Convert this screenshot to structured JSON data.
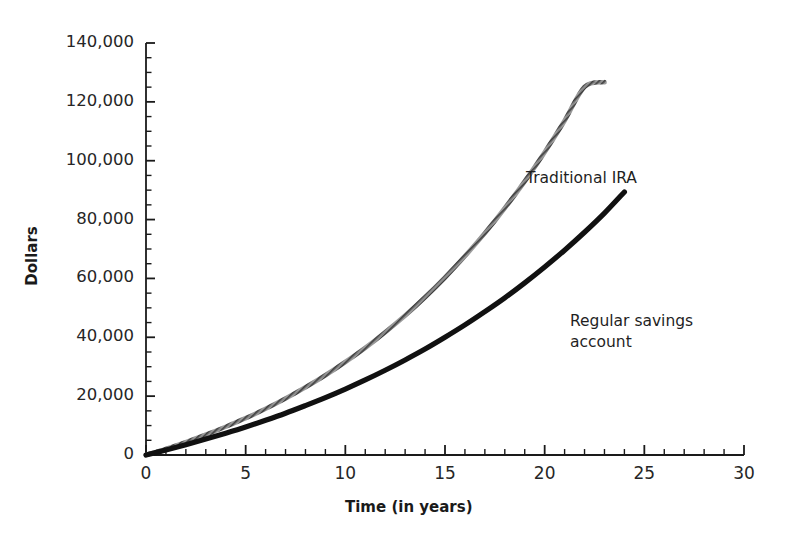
{
  "chart_data": {
    "type": "line",
    "title": "",
    "xlabel": "Time (in years)",
    "ylabel": "Dollars",
    "xlim": [
      0,
      30
    ],
    "ylim": [
      0,
      140000
    ],
    "grid": false,
    "legend_position": "inline-annotations",
    "x_ticks": [
      0,
      5,
      10,
      15,
      20,
      25,
      30
    ],
    "x_tick_labels": [
      "0",
      "5",
      "10",
      "15",
      "20",
      "25",
      "30"
    ],
    "x_minor_tick_step": 1,
    "y_ticks": [
      0,
      20000,
      40000,
      60000,
      80000,
      100000,
      120000,
      140000
    ],
    "y_tick_labels": [
      "0",
      "20,000",
      "40,000",
      "60,000",
      "80,000",
      "100,000",
      "120,000",
      "140,000"
    ],
    "y_minor_tick_step": 5000,
    "x": [
      0,
      1,
      2,
      3,
      4,
      5,
      6,
      7,
      8,
      9,
      10,
      11,
      12,
      13,
      14,
      15,
      16,
      17,
      18,
      19,
      20,
      21,
      22,
      23,
      24,
      25,
      26,
      27,
      28,
      29,
      30
    ],
    "series": [
      {
        "name": "Traditional IRA",
        "color": "#8a8a8a",
        "style": "hatched-gray",
        "values": [
          0,
          2100,
          4400,
          6900,
          9600,
          12500,
          15700,
          19200,
          23000,
          27100,
          31600,
          36400,
          41700,
          47400,
          53600,
          60300,
          67600,
          75400,
          83900,
          93000,
          102900,
          113600,
          125100,
          126700,
          126700,
          126700,
          126700,
          126700,
          126700,
          126700,
          126700
        ]
      },
      {
        "name": "Regular savings account",
        "color": "#111111",
        "style": "solid-black",
        "values": [
          0,
          1700,
          3500,
          5400,
          7400,
          9500,
          11800,
          14200,
          16800,
          19500,
          22400,
          25500,
          28800,
          32300,
          36000,
          40000,
          44200,
          48700,
          53400,
          58500,
          63900,
          69600,
          75700,
          82200,
          89400,
          89400,
          89400,
          89400,
          89400,
          89400,
          89400
        ]
      }
    ],
    "annotations": [
      {
        "text": "Traditional IRA",
        "x_year": 19,
        "y_value": 95000
      },
      {
        "text": "Regular savings\naccount",
        "x_year": 22.5,
        "y_value": 52000
      }
    ],
    "notes": {
      "ira_value_at_30": 126700,
      "savings_value_at_30": 89400,
      "ira_value_at_20": 52700,
      "savings_value_at_20": 40800
    }
  },
  "axes": {
    "x_axis_label": "Time (in years)",
    "y_axis_label": "Dollars",
    "origin_label": "0"
  },
  "annotation_labels": {
    "ira": "Traditional IRA",
    "savings_line1": "Regular savings",
    "savings_line2": "account"
  },
  "colors": {
    "axis": "#1a1a1a",
    "ira_curve": "#8a8a8a",
    "savings_curve": "#111111",
    "background": "#ffffff",
    "text": "#262626"
  }
}
